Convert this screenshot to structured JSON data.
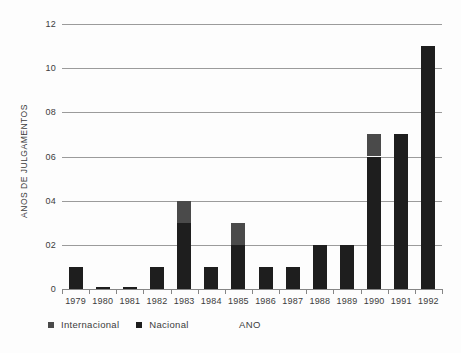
{
  "chart_data": {
    "type": "bar",
    "stacked": true,
    "title": "",
    "xlabel": "ANO",
    "ylabel": "ANOS DE JULGAMENTOS",
    "categories": [
      "1979",
      "1980",
      "1981",
      "1982",
      "1983",
      "1984",
      "1985",
      "1986",
      "1987",
      "1988",
      "1989",
      "1990",
      "1991",
      "1992"
    ],
    "series": [
      {
        "name": "Internacional",
        "color": "#4a4a4a",
        "values": [
          0,
          0,
          0,
          0,
          1,
          0,
          1,
          0,
          0,
          0,
          0,
          1,
          0,
          0
        ]
      },
      {
        "name": "Nacional",
        "color": "#1e1e1e",
        "values": [
          1,
          0,
          0,
          1,
          3,
          1,
          2,
          1,
          1,
          2,
          2,
          6,
          7,
          11
        ]
      }
    ],
    "totals": [
      1,
      0,
      0,
      1,
      4,
      1,
      3,
      1,
      1,
      2,
      2,
      7,
      7,
      11
    ],
    "ylim": [
      0,
      12
    ],
    "ytick_step": 2,
    "ytick_labels": [
      "0",
      "02",
      "04",
      "06",
      "08",
      "10",
      "12"
    ],
    "grid": true,
    "legend_position": "bottom-left",
    "colors": {
      "background": "#fdfdfd",
      "gridline": "#9b9b9b",
      "axis": "#868686",
      "text": "#3c3c3c"
    }
  }
}
